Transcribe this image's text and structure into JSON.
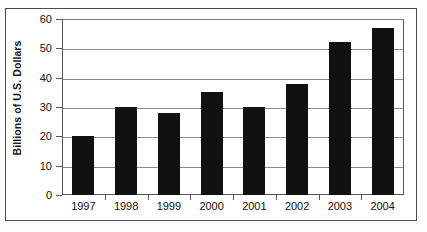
{
  "chart_data": {
    "type": "bar",
    "title": "",
    "subtitle": "",
    "xlabel": "",
    "ylabel": "Billions of U.S. Dollars",
    "categories": [
      "1997",
      "1998",
      "1999",
      "2000",
      "2001",
      "2002",
      "2003",
      "2004"
    ],
    "values": [
      20,
      30,
      28,
      35,
      30,
      38,
      52,
      57
    ],
    "series": [
      {
        "name": "",
        "values": [
          20,
          30,
          28,
          35,
          30,
          38,
          52,
          57
        ],
        "color": "#111111"
      }
    ],
    "ylim": [
      0,
      60
    ],
    "y_ticks": [
      0,
      10,
      20,
      30,
      40,
      50,
      60
    ],
    "y_tick_labels": [
      "0",
      "10",
      "20",
      "30",
      "40",
      "50",
      "60"
    ],
    "grid": {
      "horizontal": true,
      "vertical": false,
      "color": "#8c8c8c"
    },
    "legend": {
      "visible": false,
      "position": "none",
      "entries": []
    },
    "annotations": [],
    "data_labels_visible": false,
    "bar_color": "#111111",
    "plot_border_color": "#555555",
    "figure_border_color": "#4a4a4a",
    "background_color": "#ffffff"
  }
}
